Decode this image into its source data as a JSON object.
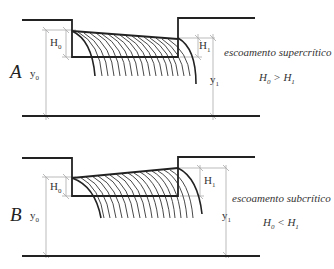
{
  "panels": [
    {
      "id": "A",
      "letter": "A",
      "h0_label": "H",
      "h0_sub": "0",
      "y0_label": "y",
      "y0_sub": "0",
      "h1_label": "H",
      "h1_sub": "1",
      "y1_label": "y",
      "y1_sub": "1",
      "flow_type": "escoamento supercrítico",
      "relation_left": "H",
      "relation_left_sub": "0",
      "relation_op": " > ",
      "relation_right": "H",
      "relation_right_sub": "1"
    },
    {
      "id": "B",
      "letter": "B",
      "h0_label": "H",
      "h0_sub": "0",
      "y0_label": "y",
      "y0_sub": "0",
      "h1_label": "H",
      "h1_sub": "1",
      "y1_label": "y",
      "y1_sub": "1",
      "flow_type": "escoamento subcrítico",
      "relation_left": "H",
      "relation_left_sub": "0",
      "relation_op": " < ",
      "relation_right": "H",
      "relation_right_sub": "1"
    }
  ],
  "colors": {
    "stroke": "#222222",
    "dimension": "#aaaaaa",
    "text": "#333333"
  }
}
